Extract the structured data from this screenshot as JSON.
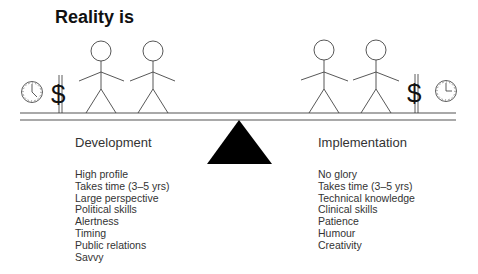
{
  "title": "Reality is",
  "left": {
    "heading": "Development",
    "items": [
      "High profile",
      "Takes time (3–5 yrs)",
      "Large perspective",
      "Political skills",
      "Alertness",
      "Timing",
      "Public relations",
      "Savvy"
    ]
  },
  "right": {
    "heading": "Implementation",
    "items": [
      "No glory",
      "Takes time (3–5 yrs)",
      "Technical knowledge",
      "Clinical skills",
      "Patience",
      "Humour",
      "Creativity"
    ]
  },
  "icons": {
    "left": [
      "clock-icon",
      "dollar-icon"
    ],
    "right": [
      "dollar-icon",
      "clock-icon"
    ],
    "dollar_glyph": "$"
  }
}
